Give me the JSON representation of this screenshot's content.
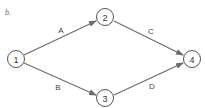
{
  "caption": "b.",
  "nodes": [
    {
      "id": "1",
      "label": "1",
      "x": 16,
      "y": 59
    },
    {
      "id": "2",
      "label": "2",
      "x": 105,
      "y": 17
    },
    {
      "id": "3",
      "label": "3",
      "x": 105,
      "y": 98
    },
    {
      "id": "4",
      "label": "4",
      "x": 192,
      "y": 59
    }
  ],
  "edges": [
    {
      "from": "1",
      "to": "2",
      "label": "A"
    },
    {
      "from": "1",
      "to": "3",
      "label": "B"
    },
    {
      "from": "2",
      "to": "4",
      "label": "C"
    },
    {
      "from": "3",
      "to": "4",
      "label": "D"
    }
  ],
  "colors": {
    "edge": "#6e6e6e",
    "node_stroke": "#555555"
  }
}
